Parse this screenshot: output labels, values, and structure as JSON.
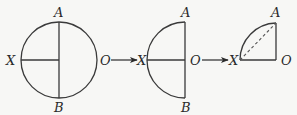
{
  "diagram": {
    "stages": [
      {
        "name": "full-circle",
        "shape": "circle",
        "labels": {
          "top": "A",
          "bottom": "B",
          "left": "X",
          "right": "O"
        }
      },
      {
        "name": "semicircle",
        "shape": "semicircle",
        "labels": {
          "top": "A",
          "bottom": "B",
          "left": "X",
          "right": "O"
        }
      },
      {
        "name": "quarter-circle",
        "shape": "quarter-circle",
        "chord": "dashed",
        "labels": {
          "top": "A",
          "left": "X",
          "right": "O"
        }
      }
    ],
    "arrows": [
      {
        "from": "O",
        "to": "X"
      },
      {
        "from": "O",
        "to": "X"
      }
    ]
  }
}
